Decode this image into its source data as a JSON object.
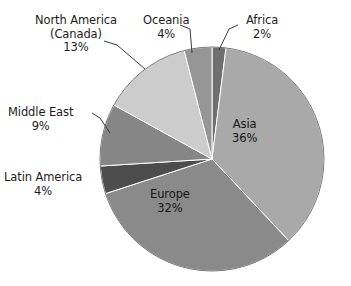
{
  "chart_data": {
    "type": "pie",
    "title": "",
    "subtitle": "",
    "xlabel": "",
    "ylabel": "",
    "legend_position": "none",
    "grid": false,
    "unit": "%",
    "total": 100,
    "start_angle_deg": 0,
    "direction": "clockwise",
    "categories": [
      "Africa",
      "Asia",
      "Europe",
      "Latin America",
      "Middle East",
      "North America (Canada)",
      "Oceania"
    ],
    "values": [
      2,
      36,
      32,
      4,
      9,
      13,
      4
    ],
    "slices": [
      {
        "name": "africa-slice",
        "label": "Africa",
        "percent_text": "2%",
        "value": 2,
        "color": "#6f6f6f",
        "label_placement": "outside",
        "label_x": 256,
        "label_y": 8,
        "leader": true
      },
      {
        "name": "asia-slice",
        "label": "Asia",
        "percent_text": "36%",
        "value": 36,
        "color": "#a9a9a9",
        "label_placement": "inside",
        "label_x": 240,
        "label_y": 118,
        "leader": false
      },
      {
        "name": "europe-slice",
        "label": "Europe",
        "percent_text": "32%",
        "value": 32,
        "color": "#8a8a8a",
        "label_placement": "inside",
        "label_x": 157,
        "label_y": 188,
        "leader": false
      },
      {
        "name": "latin-america-slice",
        "label": "Latin America",
        "percent_text": "4%",
        "value": 4,
        "color": "#4d4d4d",
        "label_placement": "outside",
        "label_x": 8,
        "label_y": 171,
        "leader": false
      },
      {
        "name": "middle-east-slice",
        "label": "Middle East",
        "percent_text": "9%",
        "value": 9,
        "color": "#868686",
        "label_placement": "outside",
        "label_x": 20,
        "label_y": 106,
        "leader": true
      },
      {
        "name": "north-america-slice",
        "label": "North America (Canada)",
        "label_line1": "North America",
        "label_line2": "(Canada)",
        "percent_text": "13%",
        "value": 13,
        "color": "#cccccc",
        "label_placement": "outside",
        "label_x": 35,
        "label_y": 14,
        "leader": true
      },
      {
        "name": "oceania-slice",
        "label": "Oceania",
        "percent_text": "4%",
        "value": 4,
        "color": "#969696",
        "label_placement": "outside",
        "label_x": 143,
        "label_y": 8,
        "leader": true
      }
    ],
    "geometry": {
      "center_x": 212,
      "center_y": 159,
      "radius": 112
    }
  }
}
